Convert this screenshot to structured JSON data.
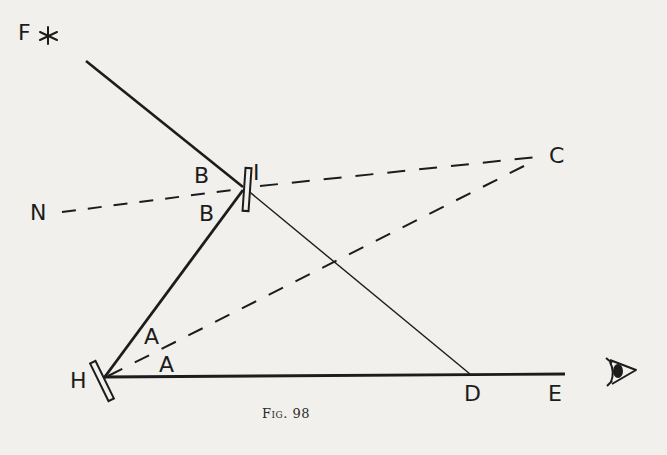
{
  "figure": {
    "caption": "Fig. 98",
    "points": {
      "F": {
        "label": "F",
        "x": 18,
        "y": 22
      },
      "N": {
        "label": "N",
        "x": 30,
        "y": 202
      },
      "I": {
        "label": "I",
        "x": 253,
        "y": 162
      },
      "C": {
        "label": "C",
        "x": 549,
        "y": 145
      },
      "H": {
        "label": "H",
        "x": 70,
        "y": 370
      },
      "D": {
        "label": "D",
        "x": 464,
        "y": 383
      },
      "E": {
        "label": "E",
        "x": 548,
        "y": 383
      }
    },
    "angle_labels": {
      "B_upper": {
        "label": "B",
        "x": 194,
        "y": 165
      },
      "B_lower": {
        "label": "B",
        "x": 199,
        "y": 203
      },
      "A_upper": {
        "label": "A",
        "x": 144,
        "y": 326
      },
      "A_lower": {
        "label": "A",
        "x": 159,
        "y": 354
      }
    },
    "icons": {
      "star": "star-icon",
      "eye": "eye-icon"
    },
    "colors": {
      "ink": "#1c1c1c",
      "paper": "#f1f0ed"
    }
  }
}
